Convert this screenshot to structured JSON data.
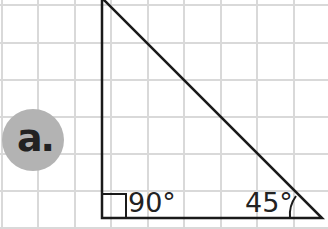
{
  "figure": {
    "label": "a.",
    "colors": {
      "grid": "#d9d9d9",
      "line": "#1a1a1a",
      "badge": "#b3b3b3",
      "text": "#222222"
    },
    "triangle": {
      "type": "right isosceles triangle",
      "right_angle_label": "90°",
      "acute_angle_label": "45°"
    }
  }
}
